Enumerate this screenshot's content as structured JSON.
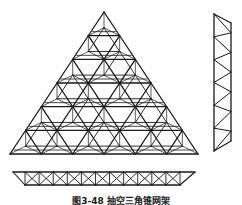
{
  "figure": {
    "caption": "图3-48  抽空三角锥网架",
    "stroke_color": "#1a1a1a",
    "background": "#ffffff"
  },
  "plan_view": {
    "apex": [
      104,
      12
    ],
    "base_left": [
      10,
      154
    ],
    "base_right": [
      198,
      154
    ],
    "divisions": 6,
    "bottom_chord_offset": 4
  },
  "side_elevation": {
    "outer_line": {
      "x": 214,
      "y_top": 14,
      "y_bottom": 151
    },
    "inner_line": {
      "x": 231,
      "y_top": 23,
      "y_bottom": 141
    },
    "panels": 6
  },
  "front_elevation": {
    "top_chord": {
      "x_start": 13,
      "x_end": 195,
      "y": 172
    },
    "bottom_chord": {
      "x_start": 25,
      "x_end": 180,
      "y": 185
    },
    "panels": 11
  }
}
